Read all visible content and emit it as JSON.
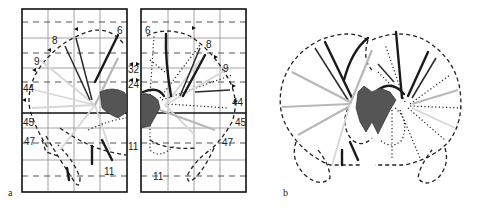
{
  "figure": {
    "panels": [
      {
        "id": "a",
        "letter": "a",
        "description": "Two gridded hemisphere projection maps (left and right) with area labels",
        "left_map": {
          "labels": {
            "area6": "6",
            "area8": "8",
            "area9": "9",
            "area44": "44",
            "area45": "45",
            "area47": "47",
            "area11": "11"
          }
        },
        "right_map": {
          "labels": {
            "area6": "6",
            "area8": "8",
            "area9": "9",
            "area44": "44",
            "area45": "45",
            "area47": "47",
            "area11": "11"
          }
        },
        "center_labels": {
          "area32": "32",
          "area24": "24",
          "area11": "11"
        }
      },
      {
        "id": "b",
        "letter": "b",
        "description": "Coronal brain outline with projection lines"
      }
    ],
    "colors": {
      "ink": "#1a1a1a",
      "gray_line": "#b8b8b8",
      "grid": "#8a8a8a",
      "background": "#ffffff"
    }
  }
}
